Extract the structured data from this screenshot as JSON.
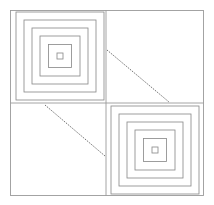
{
  "figure": {
    "title": "",
    "background_color": "#ffffff",
    "canvas": {
      "width": 214,
      "height": 205
    },
    "frame": {
      "x": 10.5,
      "y": 10.5,
      "width": 193,
      "height": 185,
      "stroke": "#9a9a9a",
      "stroke_width": 0.9
    },
    "divider": {
      "center_x": 106,
      "center_y": 103,
      "stroke": "#9a9a9a",
      "stroke_width": 0.9
    },
    "quadrants": [
      {
        "name": "top-left",
        "content": "nested-squares",
        "center_x": 60,
        "center_y": 56
      },
      {
        "name": "top-right",
        "content": "diagonal-line",
        "x1": 107,
        "y1": 50,
        "x2": 169,
        "y2": 102
      },
      {
        "name": "bottom-left",
        "content": "diagonal-line",
        "x1": 45,
        "y1": 105,
        "x2": 105,
        "y2": 156
      },
      {
        "name": "bottom-right",
        "content": "nested-squares",
        "center_x": 155,
        "center_y": 150
      }
    ],
    "nested_squares": {
      "count": 6,
      "stroke": "#8c8c8c",
      "stroke_width": 0.85,
      "sizes": [
        88,
        72,
        56,
        40,
        23,
        6
      ]
    },
    "diagonals": {
      "stroke": "#4a4a4a",
      "stroke_width": 0.8,
      "dash": "1.4 1.1"
    }
  }
}
